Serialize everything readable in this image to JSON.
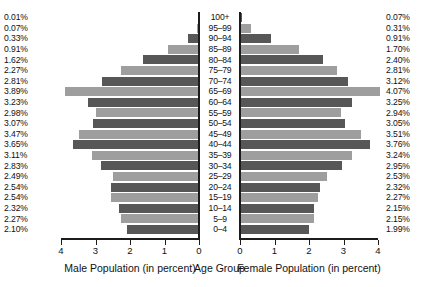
{
  "chart_data": {
    "type": "bar",
    "subtype": "population-pyramid",
    "title": "",
    "categories": [
      "100+",
      "95–99",
      "90–94",
      "85–89",
      "80–84",
      "75–79",
      "70–74",
      "65–69",
      "60–64",
      "55–59",
      "50–54",
      "45–49",
      "40–44",
      "35–39",
      "30–34",
      "25–29",
      "20–24",
      "15–19",
      "10–14",
      "5–9",
      "0–4"
    ],
    "series": [
      {
        "name": "Male Population (in percent)",
        "side": "left",
        "values": [
          0.01,
          0.07,
          0.33,
          0.91,
          1.62,
          2.27,
          2.81,
          3.89,
          3.23,
          2.98,
          3.07,
          3.47,
          3.65,
          3.11,
          2.83,
          2.49,
          2.54,
          2.54,
          2.32,
          2.27,
          2.1
        ],
        "labels": [
          "0.01%",
          "0.07%",
          "0.33%",
          "0.91%",
          "1.62%",
          "2.27%",
          "2.81%",
          "3.89%",
          "3.23%",
          "2.98%",
          "3.07%",
          "3.47%",
          "3.65%",
          "3.11%",
          "2.83%",
          "2.49%",
          "2.54%",
          "2.54%",
          "2.32%",
          "2.27%",
          "2.10%"
        ]
      },
      {
        "name": "Female Population (in percent)",
        "side": "right",
        "values": [
          0.07,
          0.31,
          0.91,
          1.7,
          2.4,
          2.81,
          3.12,
          4.07,
          3.25,
          2.94,
          3.05,
          3.51,
          3.76,
          3.24,
          2.95,
          2.53,
          2.32,
          2.27,
          2.15,
          2.15,
          1.99
        ],
        "labels": [
          "0.07%",
          "0.31%",
          "0.91%",
          "1.70%",
          "2.40%",
          "2.81%",
          "3.12%",
          "4.07%",
          "3.25%",
          "2.94%",
          "3.05%",
          "3.51%",
          "3.76%",
          "3.24%",
          "2.95%",
          "2.53%",
          "2.32%",
          "2.27%",
          "2.15%",
          "2.15%",
          "1.99%"
        ]
      }
    ],
    "center_axis_label": "Age Group",
    "left_axis_label": "Male Population (in percent)",
    "right_axis_label": "Female Population (in percent)",
    "left_ticks": [
      "4",
      "3",
      "2",
      "1",
      "0"
    ],
    "right_ticks": [
      "0",
      "1",
      "2",
      "3",
      "4"
    ],
    "xlim": [
      0,
      4
    ],
    "ylabel": "Age Group",
    "grid": false,
    "legend": "none",
    "colors": {
      "bar_dark": "#575757",
      "bar_light": "#9e9e9e",
      "axis": "#1c1c1c",
      "text": "#111111",
      "background": "#ffffff"
    }
  }
}
